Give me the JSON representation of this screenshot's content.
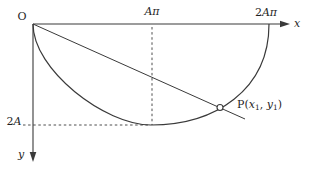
{
  "figure": {
    "background_color": "#ffffff",
    "line_color": "#3a3a3a",
    "text_color": "#1f1f1f",
    "point_fill_color": "#ffffff",
    "labels": {
      "origin": "O",
      "x_axis_var": "x",
      "y_axis_var": "y",
      "x_mid_tick": "Aπ",
      "x_end_tick_num": "2",
      "x_end_tick_var": "Aπ",
      "y_tick_num": "2",
      "y_tick_var": "A",
      "point": {
        "prefix": "P(",
        "x_var": "x",
        "x_sub": "1",
        "separator": ", ",
        "y_var": "y",
        "y_sub": "1",
        "suffix": ")"
      }
    }
  }
}
